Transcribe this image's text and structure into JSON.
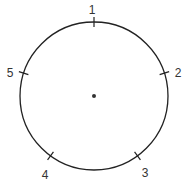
{
  "diagram": {
    "type": "circle-with-numbered-points",
    "stroke_color": "#222222",
    "label_color": "#333333",
    "center": {
      "x": 94,
      "y": 96
    },
    "radius": 74,
    "center_dot": true,
    "points": [
      {
        "label": "1",
        "angle_deg": -90
      },
      {
        "label": "2",
        "angle_deg": -18
      },
      {
        "label": "3",
        "angle_deg": 54
      },
      {
        "label": "4",
        "angle_deg": 126
      },
      {
        "label": "5",
        "angle_deg": 198
      }
    ]
  }
}
